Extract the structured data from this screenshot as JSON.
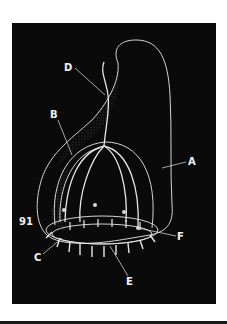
{
  "figure": {
    "number": "91",
    "background_color": "#0a0a0a",
    "line_color": "#e8e8e8",
    "labels": [
      {
        "id": "A",
        "text": "A"
      },
      {
        "id": "B",
        "text": "B"
      },
      {
        "id": "C",
        "text": "C"
      },
      {
        "id": "D",
        "text": "D"
      },
      {
        "id": "E",
        "text": "E"
      },
      {
        "id": "F",
        "text": "F"
      }
    ]
  }
}
